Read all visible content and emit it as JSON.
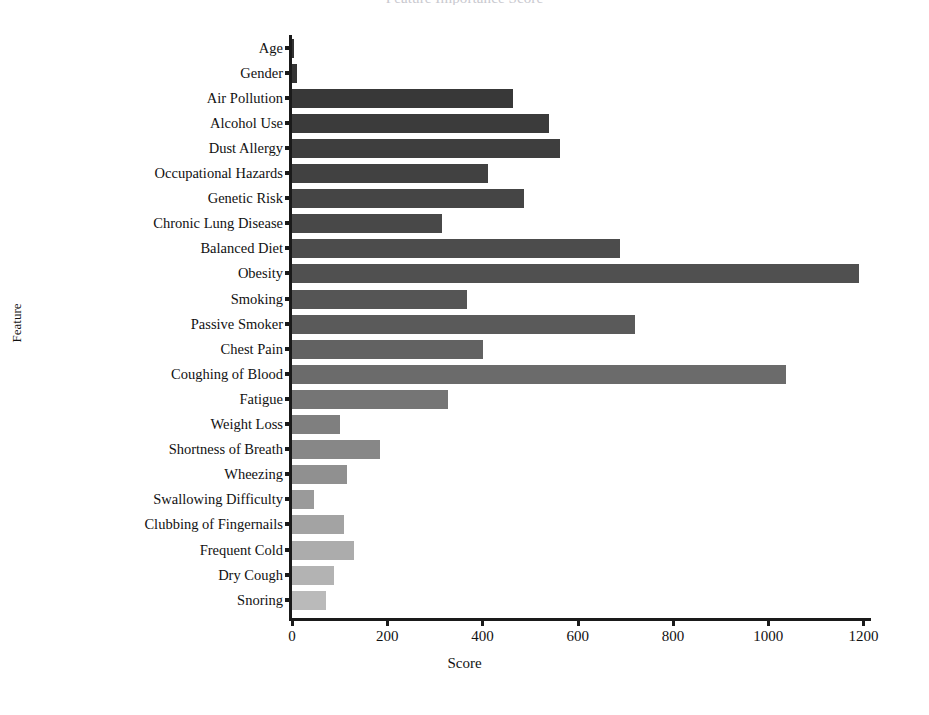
{
  "chart_data": {
    "type": "bar",
    "orientation": "horizontal",
    "title": "",
    "xlabel": "Score",
    "ylabel": "Feature",
    "xlim": [
      0,
      1260
    ],
    "xticks": [
      0,
      200,
      400,
      600,
      800,
      1000,
      1200
    ],
    "xtick_labels": [
      "0",
      "200",
      "400",
      "600",
      "800",
      "1000",
      "1200"
    ],
    "grid": false,
    "legend": false,
    "categories": [
      "Age",
      "Gender",
      "Air Pollution",
      "Alcohol Use",
      "Dust Allergy",
      "Occupational Hazards",
      "Genetic Risk",
      "Chronic Lung Disease",
      "Balanced Diet",
      "Obesity",
      "Smoking",
      "Passive Smoker",
      "Chest Pain",
      "Coughing of Blood",
      "Fatigue",
      "Weight Loss",
      "Shortness of Breath",
      "Wheezing",
      "Swallowing Difficulty",
      "Clubbing of Fingernails",
      "Frequent Cold",
      "Dry Cough",
      "Snoring"
    ],
    "values": [
      2,
      10,
      465,
      540,
      562,
      412,
      487,
      315,
      688,
      1190,
      368,
      720,
      402,
      1037,
      328,
      100,
      184,
      116,
      46,
      110,
      131,
      88,
      72
    ],
    "bar_colors": [
      "#333333",
      "#343434",
      "#383838",
      "#3b3b3b",
      "#3e3e3e",
      "#414141",
      "#454545",
      "#484848",
      "#4c4c4c",
      "#505050",
      "#555555",
      "#5a5a5a",
      "#626262",
      "#6b6b6b",
      "#757575",
      "#7f7f7f",
      "#878787",
      "#909090",
      "#9a9a9a",
      "#a3a3a3",
      "#acacac",
      "#b3b3b3",
      "#bababa"
    ]
  },
  "axis": {
    "line_color": "#1a1a1a"
  },
  "title_strip": {
    "text": "Feature Importance Score"
  },
  "ghost_strip": {
    "text": ""
  }
}
